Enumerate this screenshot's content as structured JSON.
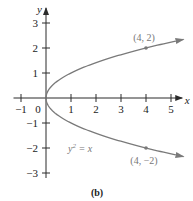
{
  "chart_data": {
    "type": "line",
    "title": "",
    "caption": "(b)",
    "xlabel": "x",
    "ylabel": "y",
    "xlim": [
      -1,
      5
    ],
    "ylim": [
      -3,
      3
    ],
    "x_ticks": [
      -1,
      0,
      1,
      2,
      3,
      4,
      5
    ],
    "x_tick_labels": [
      "−1",
      "0",
      "1",
      "2",
      "3",
      "4",
      "5"
    ],
    "y_ticks": [
      -3,
      -2,
      -1,
      1,
      2,
      3
    ],
    "y_tick_labels": [
      "−3",
      "−2",
      "−1",
      "1",
      "2",
      "3"
    ],
    "grid": false,
    "series": [
      {
        "name": "y^2 = x (upper branch)",
        "equation": "y = sqrt(x)",
        "x_range": [
          0,
          5.5
        ],
        "arrow_end": true
      },
      {
        "name": "y^2 = x (lower branch)",
        "equation": "y = -sqrt(x)",
        "x_range": [
          0,
          5.5
        ],
        "arrow_end": true
      }
    ],
    "points": [
      {
        "x": 4,
        "y": 2,
        "label": "(4, 2)"
      },
      {
        "x": 4,
        "y": -2,
        "label": "(4, −2)"
      }
    ],
    "annotations": [
      {
        "text_base": "y",
        "text_sup": "2",
        "text_rest": " = x",
        "near": {
          "x": 1,
          "y": -2
        }
      }
    ]
  }
}
